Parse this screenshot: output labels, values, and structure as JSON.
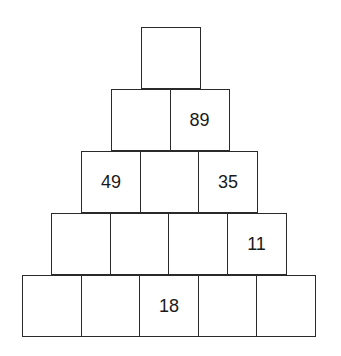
{
  "pyramid": {
    "rows": [
      {
        "cells": [
          ""
        ]
      },
      {
        "cells": [
          "",
          "89"
        ]
      },
      {
        "cells": [
          "49",
          "",
          "35"
        ]
      },
      {
        "cells": [
          "",
          "",
          "",
          "11"
        ]
      },
      {
        "cells": [
          "",
          "",
          "18",
          "",
          ""
        ]
      }
    ]
  }
}
